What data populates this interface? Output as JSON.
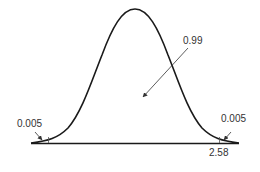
{
  "diagram": {
    "type": "normal-distribution-curve",
    "colors": {
      "curve": "#1a1a1a",
      "axis": "#1a1a1a",
      "arrow": "#333333",
      "text": "#333333"
    },
    "labels": {
      "center_area": "0.99",
      "left_tail_area": "0.005",
      "right_tail_area": "0.005",
      "right_critical_value": "2.58"
    }
  }
}
